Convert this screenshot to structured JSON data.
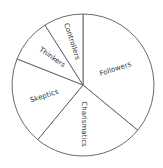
{
  "chart_data": {
    "type": "pie",
    "title": "",
    "start_angle_deg": 0,
    "direction": "clockwise",
    "categories": [
      "Followers",
      "Charismatics",
      "Skeptics",
      "Thinkers",
      "Controllers"
    ],
    "values": [
      36,
      25,
      20,
      10,
      9
    ],
    "legend": "none",
    "labels_inside": true,
    "colors": [
      "#ffffff",
      "#ffffff",
      "#ffffff",
      "#ffffff",
      "#ffffff"
    ],
    "stroke_color": "#6a6a6a"
  },
  "labels": {
    "followers": "Followers",
    "charismatics": "Charismatics",
    "skeptics": "Skeptics",
    "thinkers": "Thinkers",
    "controllers": "Controllers"
  }
}
